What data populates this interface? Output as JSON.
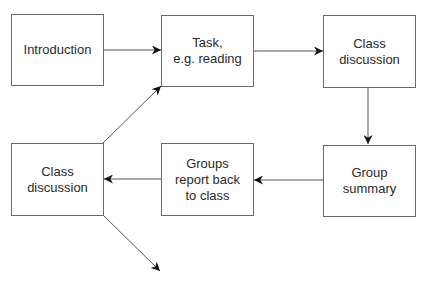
{
  "diagram": {
    "nodes": [
      {
        "id": "introduction",
        "lines": [
          "Introduction"
        ]
      },
      {
        "id": "task",
        "lines": [
          "Task,",
          "e.g. reading"
        ]
      },
      {
        "id": "class-discussion-1",
        "lines": [
          "Class",
          "discussion"
        ]
      },
      {
        "id": "group-summary",
        "lines": [
          "Group",
          "summary"
        ]
      },
      {
        "id": "groups-report",
        "lines": [
          "Groups",
          "report back",
          "to class"
        ]
      },
      {
        "id": "class-discussion-2",
        "lines": [
          "Class",
          "discussion"
        ]
      }
    ],
    "edges": [
      {
        "from": "introduction",
        "to": "task"
      },
      {
        "from": "task",
        "to": "class-discussion-1"
      },
      {
        "from": "class-discussion-1",
        "to": "group-summary"
      },
      {
        "from": "group-summary",
        "to": "groups-report"
      },
      {
        "from": "groups-report",
        "to": "class-discussion-2"
      },
      {
        "from": "class-discussion-2",
        "to": "task"
      },
      {
        "from": "class-discussion-2",
        "to": "(continues)"
      }
    ],
    "colors": {
      "stroke": "#6a6a6a",
      "text": "#2a2a2a",
      "arrowhead": "#111111"
    }
  }
}
